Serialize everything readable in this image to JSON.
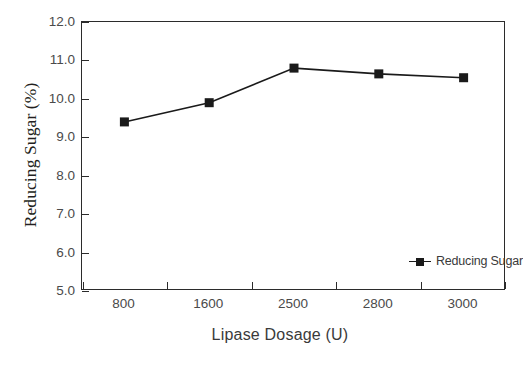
{
  "chart_data": {
    "type": "line",
    "title": "",
    "xlabel": "Lipase Dosage (U)",
    "ylabel": "Reducing Sugar (%)",
    "categories": [
      "800",
      "1600",
      "2500",
      "2800",
      "3000"
    ],
    "values": [
      9.4,
      9.9,
      10.8,
      10.65,
      10.55
    ],
    "series": [
      {
        "name": "Reducing Sugar",
        "values": [
          9.4,
          9.9,
          10.8,
          10.65,
          10.55
        ]
      }
    ],
    "ylim": [
      5.0,
      12.0
    ],
    "ytick_step": 1.0,
    "ytick_labels": [
      "12.0",
      "11.0",
      "10.0",
      "9.0",
      "8.0",
      "7.0",
      "6.0",
      "5.0"
    ],
    "ytick_values": [
      12.0,
      11.0,
      10.0,
      9.0,
      8.0,
      7.0,
      6.0,
      5.0
    ],
    "grid": false,
    "legend_position": "inside-bottom-center",
    "legend_entries": [
      "Reducing Sugar"
    ],
    "marker": "square",
    "series_color": "#1a1a1a",
    "axis_color": "#2b2b2b",
    "background": "#ffffff"
  }
}
